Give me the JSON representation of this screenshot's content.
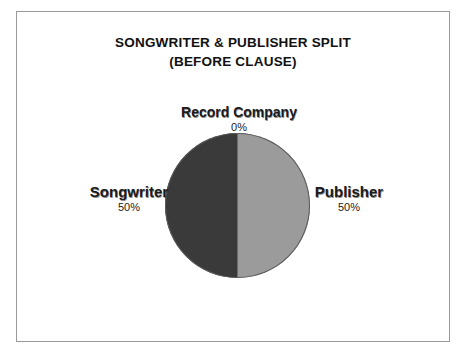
{
  "chart_data": {
    "type": "pie",
    "title": "SONGWRITER & PUBLISHER SPLIT",
    "subtitle": "(BEFORE CLAUSE)",
    "categories": [
      "Record Company",
      "Songwriter",
      "Publisher"
    ],
    "values": [
      0,
      50,
      50
    ],
    "labels": [
      "0%",
      "50%",
      "50%"
    ],
    "colors": [
      "#ffffff",
      "#3a3a3a",
      "#9b9b9b"
    ],
    "legend": false,
    "grid": false,
    "xlabel": "",
    "ylabel": ""
  },
  "slices": {
    "record_company": {
      "name": "Record Company",
      "pct": "0%"
    },
    "songwriter": {
      "name": "Songwriter",
      "pct": "50%"
    },
    "publisher": {
      "name": "Publisher",
      "pct": "50%"
    }
  }
}
